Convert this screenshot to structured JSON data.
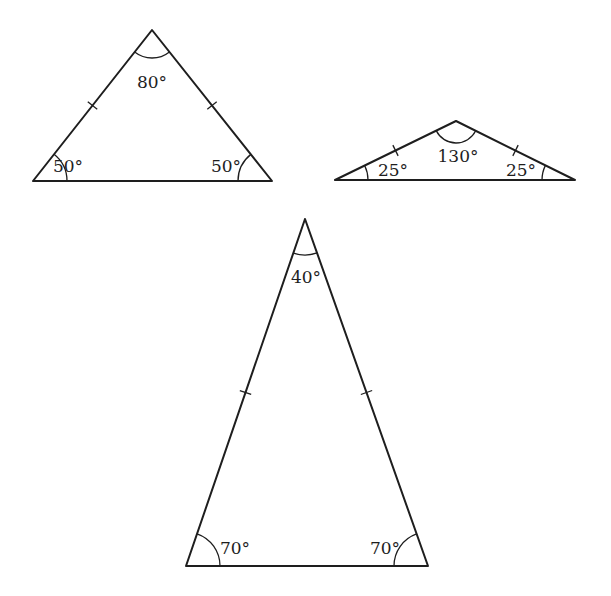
{
  "diagram": {
    "line_color": "#1e1e1e",
    "background": "#ffffff",
    "triangles": [
      {
        "id": "triangle-1",
        "vertices": {
          "apex": [
            152,
            30
          ],
          "left": [
            33,
            181
          ],
          "right": [
            272,
            181
          ]
        },
        "angles": {
          "apex": "80°",
          "left": "50°",
          "right": "50°"
        },
        "label_pos": {
          "apex": [
            152,
            88
          ],
          "left": [
            68,
            172
          ],
          "right": [
            226,
            172
          ]
        },
        "arc_radius": {
          "apex": 28,
          "base": 34
        }
      },
      {
        "id": "triangle-2",
        "vertices": {
          "apex": [
            456,
            121
          ],
          "left": [
            335,
            180
          ],
          "right": [
            575,
            180
          ]
        },
        "angles": {
          "apex": "130°",
          "left": "25°",
          "right": "25°"
        },
        "label_pos": {
          "apex": [
            458,
            162
          ],
          "left": [
            393,
            176
          ],
          "right": [
            521,
            176
          ]
        },
        "arc_radius": {
          "apex": 22,
          "base": 33
        }
      },
      {
        "id": "triangle-3",
        "vertices": {
          "apex": [
            305,
            219
          ],
          "left": [
            186,
            566
          ],
          "right": [
            428,
            566
          ]
        },
        "angles": {
          "apex": "40°",
          "left": "70°",
          "right": "70°"
        },
        "label_pos": {
          "apex": [
            306,
            283
          ],
          "left": [
            235,
            554
          ],
          "right": [
            385,
            554
          ]
        },
        "arc_radius": {
          "apex": 36,
          "base": 34
        }
      }
    ]
  }
}
